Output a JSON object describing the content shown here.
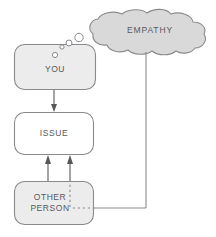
{
  "diagram": {
    "type": "flow-diagram",
    "background_color": "#ffffff",
    "stroke_color": "#7f7f83",
    "text_color": "#58585a",
    "fill_gray": "#ececed",
    "fill_white": "#ffffff",
    "nodes": [
      {
        "id": "you",
        "label": "YOU",
        "shape": "rounded-rectangle",
        "fill": "#ececed",
        "x": 14,
        "y": 44,
        "width": 82,
        "height": 46
      },
      {
        "id": "issue",
        "label": "ISSUE",
        "shape": "rounded-rectangle",
        "fill": "#ffffff",
        "x": 14,
        "y": 112,
        "width": 80,
        "height": 43
      },
      {
        "id": "other-person",
        "label_line1": "OTHER",
        "label_line2": "PERSON",
        "shape": "rounded-rectangle",
        "fill": "#ececed",
        "x": 14,
        "y": 181,
        "width": 80,
        "height": 44
      },
      {
        "id": "empathy",
        "label": "EMPATHY",
        "shape": "thought-cloud",
        "fill": "#d9d9da",
        "x": 88,
        "y": 12,
        "width": 118,
        "height": 42
      }
    ],
    "thought_bubbles": [
      {
        "cx": 55,
        "cy": 55,
        "r": 2.6
      },
      {
        "cx": 62,
        "cy": 47,
        "r": 2.1
      },
      {
        "cx": 69,
        "cy": 43,
        "r": 3.0
      },
      {
        "cx": 79,
        "cy": 38,
        "r": 4.2
      }
    ],
    "connectors": [
      {
        "id": "you-to-issue",
        "from": "you",
        "to": "issue",
        "style": "solid",
        "arrow": true
      },
      {
        "id": "other-person-to-issue-solid",
        "from": "other-person",
        "to": "issue",
        "style": "solid",
        "arrow": true
      },
      {
        "id": "other-person-to-issue-dashed",
        "from": "other-person",
        "to": "issue",
        "style": "dashed-then-solid",
        "arrow": true
      },
      {
        "id": "empathy-to-other-person",
        "from": "empathy",
        "to": "other-person",
        "style": "solid-then-dashed",
        "arrow": false
      }
    ]
  }
}
